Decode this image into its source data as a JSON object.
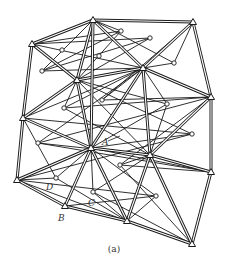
{
  "figure": {
    "caption": "(a)",
    "labels": [
      {
        "text": "A",
        "x": 102,
        "y": 145
      },
      {
        "text": "D",
        "x": 46,
        "y": 190
      },
      {
        "text": "C",
        "x": 88,
        "y": 206
      },
      {
        "text": "B",
        "x": 58,
        "y": 221
      }
    ],
    "colors": {
      "line": "#1a1a1a",
      "background": "#ffffff"
    },
    "triangulation_stations": [
      [
        93,
        20
      ],
      [
        193,
        22
      ],
      [
        32,
        44
      ],
      [
        77,
        80
      ],
      [
        143,
        68
      ],
      [
        211,
        97
      ],
      [
        23,
        118
      ],
      [
        91,
        148
      ],
      [
        150,
        155
      ],
      [
        211,
        172
      ],
      [
        17,
        180
      ],
      [
        65,
        206
      ],
      [
        127,
        221
      ],
      [
        192,
        244
      ]
    ],
    "minor_points": [
      [
        62,
        50
      ],
      [
        99,
        56
      ],
      [
        42,
        71
      ],
      [
        121,
        31
      ],
      [
        150,
        38
      ],
      [
        174,
        63
      ],
      [
        102,
        100
      ],
      [
        64,
        108
      ],
      [
        167,
        104
      ],
      [
        192,
        134
      ],
      [
        38,
        143
      ],
      [
        120,
        165
      ],
      [
        56,
        178
      ],
      [
        93,
        192
      ],
      [
        156,
        196
      ]
    ],
    "double_edges": [
      [
        0,
        1
      ],
      [
        0,
        2
      ],
      [
        2,
        6
      ],
      [
        1,
        5
      ],
      [
        5,
        9
      ],
      [
        9,
        13
      ],
      [
        6,
        10
      ],
      [
        10,
        11
      ],
      [
        11,
        12
      ],
      [
        12,
        13
      ],
      [
        0,
        3
      ],
      [
        2,
        3
      ],
      [
        0,
        4
      ],
      [
        1,
        4
      ],
      [
        3,
        4
      ],
      [
        4,
        5
      ],
      [
        3,
        6
      ],
      [
        3,
        7
      ],
      [
        4,
        7
      ],
      [
        4,
        8
      ],
      [
        6,
        7
      ],
      [
        7,
        8
      ],
      [
        8,
        5
      ],
      [
        8,
        9
      ],
      [
        7,
        10
      ],
      [
        7,
        11
      ],
      [
        7,
        12
      ],
      [
        8,
        12
      ],
      [
        8,
        13
      ],
      [
        0,
        7
      ]
    ],
    "single_edges": [
      [
        0,
        17
      ],
      [
        17,
        2
      ],
      [
        17,
        3
      ],
      [
        17,
        16
      ],
      [
        0,
        16
      ],
      [
        16,
        18
      ],
      [
        16,
        4
      ],
      [
        18,
        3
      ],
      [
        18,
        2
      ],
      [
        0,
        19
      ],
      [
        19,
        1
      ],
      [
        19,
        4
      ],
      [
        1,
        20
      ],
      [
        20,
        4
      ],
      [
        20,
        5
      ],
      [
        4,
        21
      ],
      [
        21,
        5
      ],
      [
        21,
        8
      ],
      [
        3,
        21
      ],
      [
        3,
        22
      ],
      [
        22,
        4
      ],
      [
        22,
        7
      ],
      [
        22,
        8
      ],
      [
        6,
        23
      ],
      [
        23,
        3
      ],
      [
        23,
        7
      ],
      [
        23,
        10
      ],
      [
        8,
        24
      ],
      [
        24,
        5
      ],
      [
        24,
        9
      ],
      [
        24,
        4
      ],
      [
        9,
        25
      ],
      [
        25,
        8
      ],
      [
        25,
        5
      ],
      [
        25,
        13
      ],
      [
        10,
        26
      ],
      [
        26,
        6
      ],
      [
        26,
        7
      ],
      [
        26,
        12
      ],
      [
        7,
        27
      ],
      [
        27,
        8
      ],
      [
        27,
        12
      ],
      [
        27,
        13
      ],
      [
        11,
        28
      ],
      [
        28,
        10
      ],
      [
        28,
        7
      ],
      [
        28,
        12
      ],
      [
        12,
        29
      ],
      [
        29,
        7
      ],
      [
        29,
        11
      ],
      [
        29,
        8
      ],
      [
        13,
        30
      ],
      [
        30,
        8
      ],
      [
        30,
        9
      ],
      [
        30,
        12
      ],
      [
        6,
        4
      ],
      [
        2,
        4
      ],
      [
        3,
        8
      ],
      [
        7,
        9
      ],
      [
        10,
        12
      ]
    ]
  }
}
